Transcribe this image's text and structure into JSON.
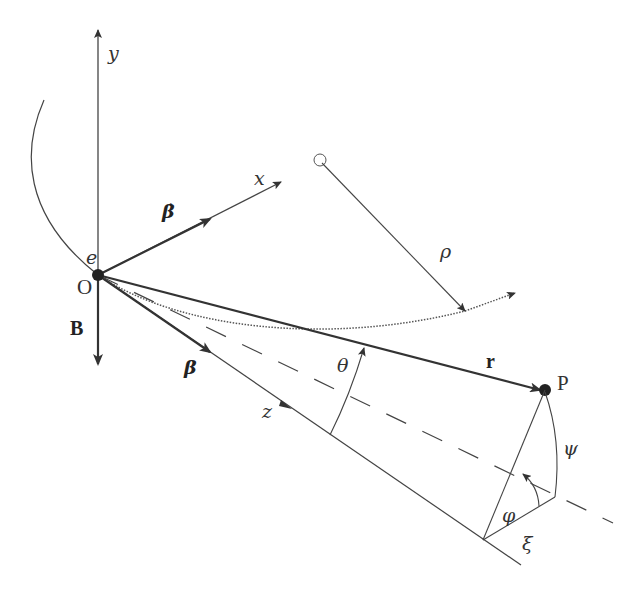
{
  "diagram": {
    "colors": {
      "line": "#333333",
      "background": "#ffffff"
    },
    "labels": {
      "y_axis": "y",
      "x_axis": "x",
      "z_axis": "z",
      "electron": "e",
      "origin": "O",
      "magnetic_field": "B",
      "acceleration": "β̇",
      "velocity": "β",
      "radius": "ρ",
      "position_vector": "r",
      "observation_point": "P",
      "angle_theta": "θ",
      "angle_psi": "ψ",
      "angle_phi": "φ",
      "angle_xi": "ξ"
    }
  }
}
